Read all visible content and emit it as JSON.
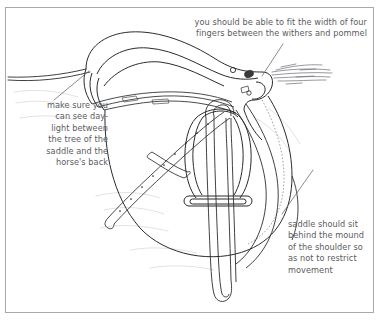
{
  "figure": {
    "background_color": "#ffffff",
    "border_color": "#a8a8a8",
    "ink_color": "#2b2b2b",
    "text_color": "#5b5b60",
    "ghost_color": "#c9c9cc"
  },
  "annotations": [
    {
      "id": "pommel-clearance",
      "text": "you should be able to fit the width of four\nfingers between the withers and pommel",
      "align": "right",
      "leader": {
        "from_x": 283,
        "from_y": 44,
        "to_x": 262,
        "to_y": 76
      }
    },
    {
      "id": "tree-daylight",
      "text": "make sure you\ncan see day-\nlight between\nthe tree of the\nsaddle and the\nhorse's back",
      "align": "right",
      "leader": {
        "from_x": 54,
        "from_y": 100,
        "to_x": 89,
        "to_y": 71
      }
    },
    {
      "id": "shoulder-clearance",
      "text": "saddle should sit\nbehind the mound\nof the shoulder so\nas not to restrict\nmovement",
      "align": "left",
      "leader": {
        "from_x": 282,
        "from_y": 214,
        "to_x": 313,
        "to_y": 170
      }
    }
  ],
  "drawing_parts": [
    "horse-back-line",
    "saddle-cantle",
    "saddle-seat",
    "saddle-pommel",
    "saddle-flap",
    "saddle-panel",
    "knee-roll",
    "stirrup-bar-stud",
    "stirrup-leather",
    "stirrup-iron",
    "girth-strap",
    "horse-mane"
  ]
}
